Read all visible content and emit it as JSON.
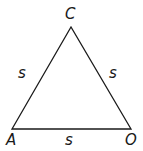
{
  "diagram": {
    "type": "equilateral-triangle",
    "vertices": [
      {
        "name": "C",
        "x": 71,
        "y": 27
      },
      {
        "name": "A",
        "x": 12,
        "y": 129
      },
      {
        "name": "O",
        "x": 131,
        "y": 129
      }
    ],
    "vertex_labels": {
      "C": "C",
      "A": "A",
      "O": "O"
    },
    "side_labels": {
      "CA": "s",
      "CO": "s",
      "AO": "s"
    },
    "stroke_color": "#1a1a1a"
  }
}
